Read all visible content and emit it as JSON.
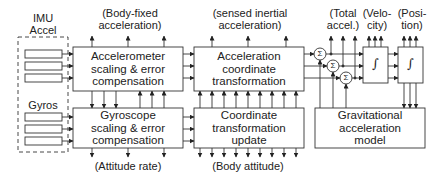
{
  "imu": {
    "title": "IMU",
    "accel_label": "Accel",
    "gyros_label": "Gyros"
  },
  "blocks": {
    "accelerometer": [
      "Accelerometer",
      "scaling & error",
      "compensation"
    ],
    "gyroscope": [
      "Gyroscope",
      "scaling & error",
      "compensation"
    ],
    "accel_transform": [
      "Acceleration",
      "coordinate",
      "transformation"
    ],
    "coord_update": [
      "Coordinate",
      "transformation",
      "update"
    ],
    "gravity": [
      "Gravitational",
      "acceleration",
      "model"
    ],
    "integrator_symbol": "∫",
    "sum_symbol": "Σ"
  },
  "signals": {
    "body_fixed_accel": [
      "(Body-fixed",
      "acceleration)"
    ],
    "sensed_inertial_accel": [
      "(sensed inertial",
      "acceleration)"
    ],
    "total_accel": [
      "(Total",
      "accel.)"
    ],
    "velocity": [
      "(Velo-",
      "city)"
    ],
    "position": [
      "(Posi-",
      "tion)"
    ],
    "attitude_rate": "(Attitude rate)",
    "body_attitude": "(Body attitude)"
  },
  "colors": {
    "line": "#333333",
    "background": "#ffffff"
  }
}
